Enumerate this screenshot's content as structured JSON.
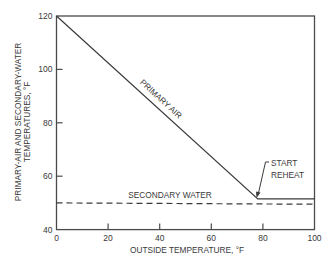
{
  "chart_data": {
    "type": "line",
    "title": "",
    "xlabel": "OUTSIDE TEMPERATURE, °F",
    "ylabel": [
      "PRIMARY-AIR AND SECONDARY-WATER",
      "TEMPERATURES, °F"
    ],
    "xlim": [
      0,
      100
    ],
    "ylim": [
      40,
      120
    ],
    "xticks": [
      0,
      20,
      40,
      60,
      80,
      100
    ],
    "yticks": [
      40,
      60,
      80,
      100,
      120
    ],
    "grid": false,
    "legend": null,
    "series": [
      {
        "name": "PRIMARY AIR",
        "style": "solid",
        "x": [
          0,
          78,
          100
        ],
        "y": [
          120,
          51.5,
          51.5
        ]
      },
      {
        "name": "SECONDARY WATER",
        "style": "dashed",
        "x": [
          0,
          100
        ],
        "y": [
          50,
          49.5
        ]
      }
    ],
    "annotations": [
      {
        "text": [
          "START",
          "REHEAT"
        ],
        "arrow_to": {
          "x": 78,
          "y": 51.5
        }
      },
      {
        "text": "PRIMARY AIR",
        "along_series": "PRIMARY AIR"
      },
      {
        "text": "SECONDARY WATER",
        "above_series": "SECONDARY WATER"
      }
    ]
  },
  "colors": {
    "line": "#3a3a3a",
    "text": "#3a3a3a",
    "background": "#ffffff"
  }
}
